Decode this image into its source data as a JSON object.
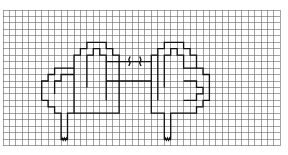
{
  "diagram": {
    "type": "grid-pattern-chart",
    "grid": {
      "x0": 3,
      "y0": 10,
      "cols": 43,
      "rows": 21,
      "cell": 6.45,
      "line_color": "#555555",
      "outline_color": "#111111"
    },
    "motifs": [
      {
        "name": "left-motif",
        "stitch_mark": "wavy"
      },
      {
        "name": "right-motif",
        "stitch_mark": "wavy"
      }
    ],
    "center_marks": [
      "bracket-left",
      "bracket-right"
    ]
  }
}
